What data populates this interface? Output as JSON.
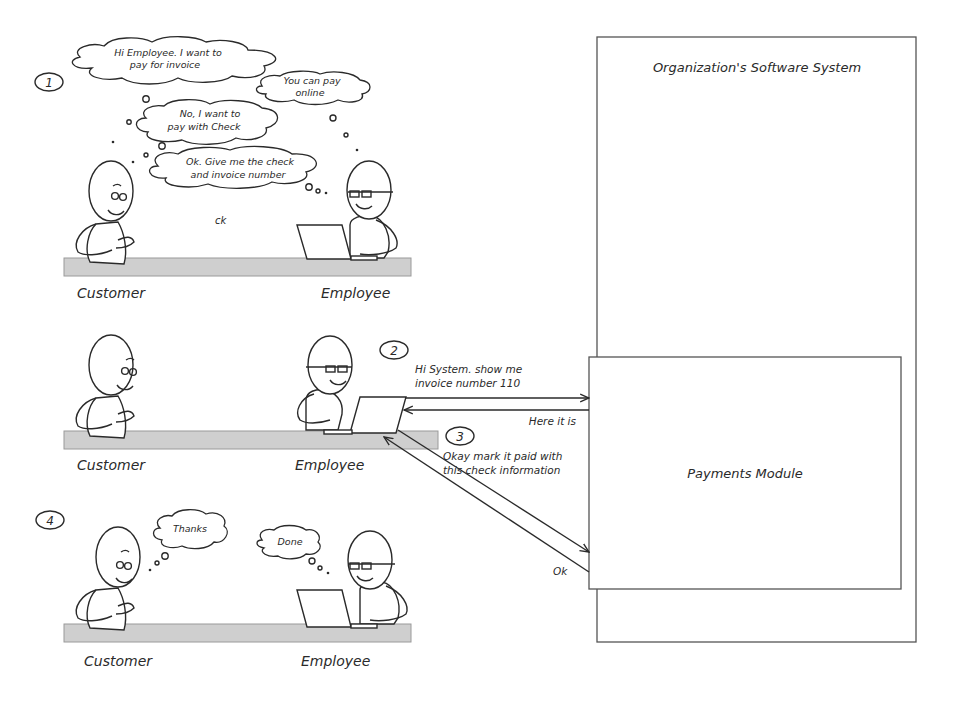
{
  "colors": {
    "ink": "#2a2a2a",
    "desk": "#cfcfcf",
    "box_border": "#555555",
    "background": "#ffffff"
  },
  "system": {
    "title": "Organization's Software System",
    "module": "Payments Module"
  },
  "scenes": [
    {
      "step": "1",
      "customer_label": "Customer",
      "employee_label": "Employee",
      "bubbles": [
        {
          "speaker": "customer",
          "line1": "Hi Employee. I want to",
          "line2": "pay for invoice"
        },
        {
          "speaker": "employee",
          "line1": "You can pay",
          "line2": "online"
        },
        {
          "speaker": "customer",
          "line1": "No, I want to",
          "line2": "pay with Check"
        },
        {
          "speaker": "employee",
          "line1": "Ok. Give me the check",
          "line2": "and invoice number"
        }
      ],
      "stray_text": "ck"
    },
    {
      "step": "2",
      "customer_label": "Customer",
      "employee_label": "Employee"
    },
    {
      "step": "4",
      "customer_label": "Customer",
      "employee_label": "Employee",
      "bubbles": [
        {
          "speaker": "customer",
          "line1": "Thanks"
        },
        {
          "speaker": "employee",
          "line1": "Done"
        }
      ]
    }
  ],
  "messages": [
    {
      "step": "2",
      "direction": "to-system",
      "line1": "Hi System. show me",
      "line2": "invoice number 110"
    },
    {
      "step": "",
      "direction": "to-employee",
      "line1": "Here it is"
    },
    {
      "step": "3",
      "direction": "to-system",
      "line1": "Okay mark it paid with",
      "line2": "this check information"
    },
    {
      "step": "",
      "direction": "to-employee",
      "line1": "Ok"
    }
  ]
}
